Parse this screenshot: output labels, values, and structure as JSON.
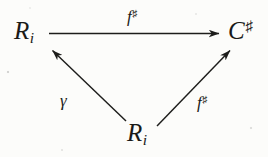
{
  "diagram": {
    "type": "commutative-triangle",
    "background_color": "#fcfcfa",
    "ink_color": "#1a1a18",
    "nodes": [
      {
        "id": "source-top",
        "position": "top-left",
        "base": "R",
        "subscript": "i",
        "superscript": "",
        "text": "R_i"
      },
      {
        "id": "target",
        "position": "top-right",
        "base": "C",
        "subscript": "",
        "superscript": "♯",
        "text": "C♯"
      },
      {
        "id": "source-bottom",
        "position": "bottom-center",
        "base": "R",
        "subscript": "i",
        "superscript": "",
        "text": "R_i"
      }
    ],
    "edges": [
      {
        "id": "top-arrow",
        "from": "source-top",
        "to": "target",
        "direction": "right",
        "label_base": "f",
        "label_superscript": "♯",
        "label_text": "f♯",
        "label_position": "above"
      },
      {
        "id": "left-arrow",
        "from": "source-bottom",
        "to": "source-top",
        "direction": "up-left",
        "label_base": "γ",
        "label_superscript": "",
        "label_text": "γ",
        "label_position": "left"
      },
      {
        "id": "right-arrow",
        "from": "source-bottom",
        "to": "target",
        "direction": "up-right",
        "label_base": "f",
        "label_superscript": "♯",
        "label_text": "f♯",
        "label_position": "right"
      }
    ]
  }
}
